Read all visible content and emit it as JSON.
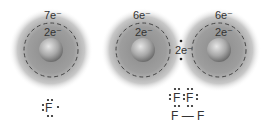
{
  "diagram": {
    "atoms": [
      {
        "id": "fluorine-atom-single",
        "cx": 51,
        "cy": 50,
        "outer_label": "7e⁻",
        "inner_label": "2e⁻"
      },
      {
        "id": "fluorine-atom-left",
        "cx": 143,
        "cy": 50,
        "outer_label": "6e⁻",
        "inner_label": "2e⁻"
      },
      {
        "id": "fluorine-atom-right",
        "cx": 219,
        "cy": 50,
        "outer_label": "6e⁻",
        "inner_label": "2e⁻"
      }
    ],
    "shared_pair_label": "2e⁻",
    "lewis_single": "F",
    "lewis_molecule": [
      "F",
      "F"
    ],
    "structural_formula": "F — F",
    "colors": {
      "shell": "#555555",
      "dot": "#222222",
      "text": "#333333"
    }
  }
}
